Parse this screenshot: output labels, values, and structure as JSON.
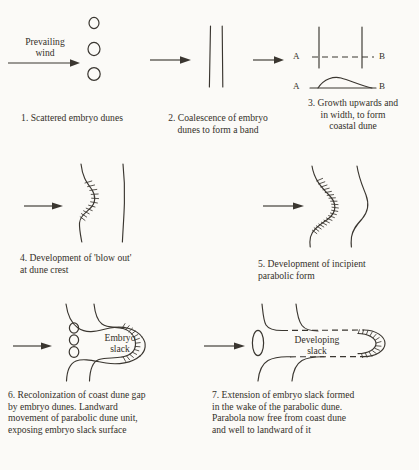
{
  "figure": {
    "background_color": "#fbfaf7",
    "ink_color": "#3a3630"
  },
  "labels": {
    "prevailing_wind": "Prevailing\nwind",
    "embryo_slack": "Embryo\nslack",
    "developing_slack": "Developing\nslack",
    "a_upper": "A",
    "b_upper": "B",
    "a_lower": "A",
    "b_lower": "B"
  },
  "panels": [
    {
      "number": "1",
      "caption": "1. Scattered embryo dunes",
      "content": "three small embryo dune ellipses with prevailing wind arrow"
    },
    {
      "number": "2",
      "caption": "2. Coalescence of embryo\ndunes to form a band",
      "content": "two close parallel vertical lines forming a band"
    },
    {
      "number": "3",
      "caption": "3. Growth upwards and\nin width, to form\ncoastal dune",
      "content": "plan view two vertical lines with dashed section line A-B and profile mound A-B"
    },
    {
      "number": "4",
      "caption": "4. Development of 'blow out'\nat dune crest",
      "content": "wavy seaward line with hatched blow-out and straight landward line"
    },
    {
      "number": "5",
      "caption": "5. Development of incipient\nparabolic form",
      "content": "two curved lines, seaward one heavily hatched into incipient parabola"
    },
    {
      "number": "6",
      "caption": "6. Recolonization of coast dune gap\nby embryo dunes. Landward\nmovement of parabolic dune unit,\nexposing embryo slack surface",
      "content": "parabolic dune with hatched nose, Embryo slack label and three embryo dune ellipses"
    },
    {
      "number": "7",
      "caption": "7. Extension of embryo slack formed\nin the wake of the parabolic dune.\nParabola now free from coast dune\nand well to landward of it",
      "content": "elongated parabola with dashed arms, hatched nose, Developing slack label and one ellipse"
    }
  ],
  "arrows": [
    {
      "name": "prevailing-wind-arrow",
      "from_panel": "wind",
      "to_panel": "1"
    },
    {
      "name": "stage-arrow-1-2",
      "from_panel": "1",
      "to_panel": "2"
    },
    {
      "name": "stage-arrow-2-3",
      "from_panel": "2",
      "to_panel": "3"
    },
    {
      "name": "stage-arrow-4",
      "from_panel": "3",
      "to_panel": "4"
    },
    {
      "name": "stage-arrow-5",
      "from_panel": "4",
      "to_panel": "5"
    },
    {
      "name": "stage-arrow-6",
      "from_panel": "5",
      "to_panel": "6"
    },
    {
      "name": "stage-arrow-7",
      "from_panel": "6",
      "to_panel": "7"
    }
  ]
}
